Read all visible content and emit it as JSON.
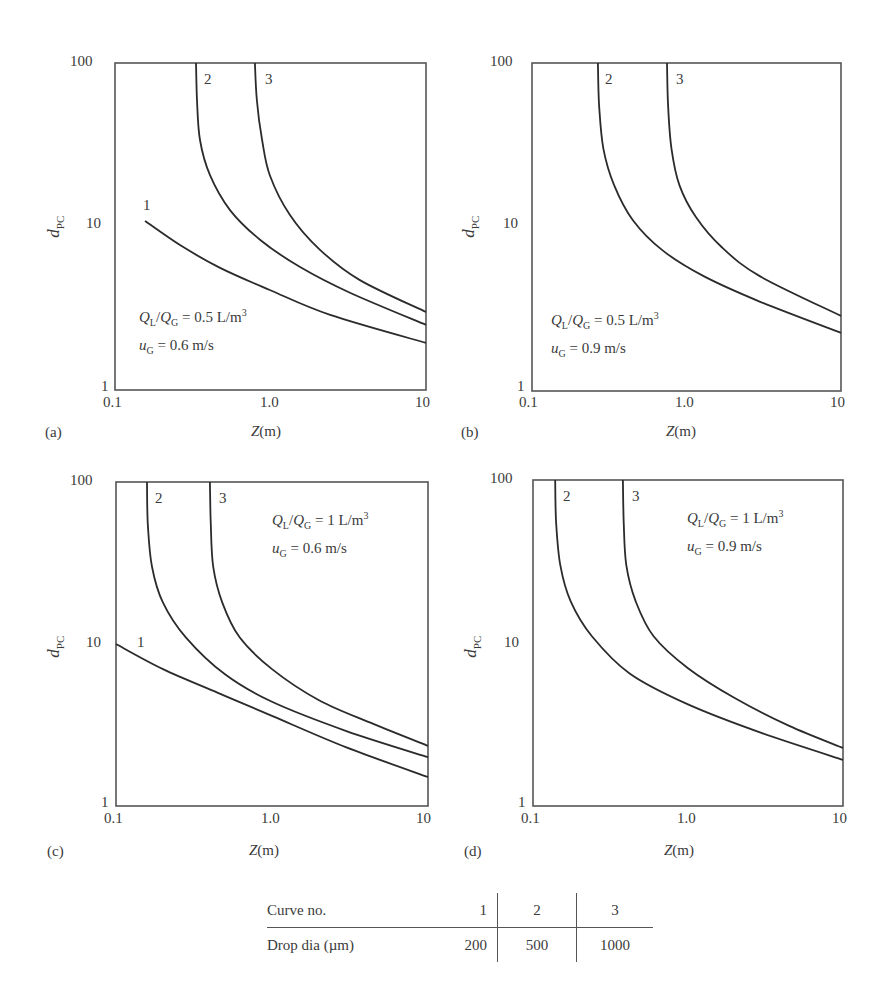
{
  "figure": {
    "legend_table": {
      "header": {
        "label": "Curve no.",
        "values": [
          "1",
          "2",
          "3"
        ]
      },
      "row": {
        "label": "Drop dia (µm)",
        "values": [
          "200",
          "500",
          "1000"
        ]
      }
    }
  },
  "chart_data": [
    {
      "type": "line",
      "panel": "(a)",
      "xlabel": "Z(m)",
      "ylabel": "dPC",
      "xscale": "log",
      "yscale": "log",
      "xlim": [
        0.1,
        10
      ],
      "ylim": [
        1,
        100
      ],
      "xticks": [
        "0.1",
        "1.0",
        "10"
      ],
      "yticks": [
        "1",
        "10",
        "100"
      ],
      "annotation": [
        "QL/QG = 0.5 L/m3",
        "uG = 0.6 m/s"
      ],
      "series": [
        {
          "name": "1",
          "drop_dia_um": 200,
          "points": [
            [
              0.156,
              10.8
            ],
            [
              0.262,
              7.7
            ],
            [
              0.474,
              5.58
            ],
            [
              0.99,
              4.09
            ],
            [
              2.42,
              2.88
            ],
            [
              10,
              1.94
            ]
          ]
        },
        {
          "name": "2",
          "drop_dia_um": 500,
          "points": [
            [
              0.332,
              100
            ],
            [
              0.337,
              59
            ],
            [
              0.352,
              33.8
            ],
            [
              0.408,
              20.6
            ],
            [
              0.549,
              12.6
            ],
            [
              0.856,
              8.3
            ],
            [
              1.55,
              5.65
            ],
            [
              3.27,
              3.92
            ],
            [
              10,
              2.5
            ]
          ]
        },
        {
          "name": "3",
          "drop_dia_um": 1000,
          "points": [
            [
              0.794,
              100
            ],
            [
              0.817,
              59
            ],
            [
              0.883,
              33.8
            ],
            [
              0.99,
              20.6
            ],
            [
              1.33,
              11.8
            ],
            [
              2.08,
              7.2
            ],
            [
              3.76,
              4.7
            ],
            [
              10,
              3.0
            ]
          ]
        }
      ]
    },
    {
      "type": "line",
      "panel": "(b)",
      "xlabel": "Z(m)",
      "ylabel": "dPC",
      "xscale": "log",
      "yscale": "log",
      "xlim": [
        0.1,
        10
      ],
      "ylim": [
        1,
        100
      ],
      "xticks": [
        "0.1",
        "1.0",
        "10"
      ],
      "yticks": [
        "1",
        "10",
        "100"
      ],
      "annotation": [
        "QL/QG = 0.5 L/m3",
        "uG = 0.9 m/s"
      ],
      "series": [
        {
          "name": "2",
          "drop_dia_um": 500,
          "points": [
            [
              0.267,
              100
            ],
            [
              0.272,
              55
            ],
            [
              0.29,
              30
            ],
            [
              0.34,
              18
            ],
            [
              0.45,
              11
            ],
            [
              0.7,
              7.2
            ],
            [
              1.3,
              5.0
            ],
            [
              3.0,
              3.5
            ],
            [
              10,
              2.26
            ]
          ]
        },
        {
          "name": "3",
          "drop_dia_um": 1000,
          "points": [
            [
              0.748,
              100
            ],
            [
              0.76,
              55
            ],
            [
              0.8,
              30
            ],
            [
              0.9,
              18
            ],
            [
              1.15,
              11.5
            ],
            [
              1.7,
              7.5
            ],
            [
              3.0,
              5.0
            ],
            [
              10,
              2.87
            ]
          ]
        }
      ]
    },
    {
      "type": "line",
      "panel": "(c)",
      "xlabel": "Z(m)",
      "ylabel": "dPC",
      "xscale": "log",
      "yscale": "log",
      "xlim": [
        0.1,
        10
      ],
      "ylim": [
        1,
        100
      ],
      "xticks": [
        "0.1",
        "1.0",
        "10"
      ],
      "yticks": [
        "1",
        "10",
        "100"
      ],
      "annotation": [
        "QL/QG = 1 L/m3",
        "uG = 0.6 m/s"
      ],
      "series": [
        {
          "name": "1",
          "drop_dia_um": 200,
          "points": [
            [
              0.1,
              10
            ],
            [
              0.2,
              7.0
            ],
            [
              0.45,
              5.0
            ],
            [
              1.0,
              3.6
            ],
            [
              3.0,
              2.3
            ],
            [
              10,
              1.51
            ]
          ]
        },
        {
          "name": "2",
          "drop_dia_um": 500,
          "points": [
            [
              0.158,
              100
            ],
            [
              0.16,
              55
            ],
            [
              0.17,
              30
            ],
            [
              0.2,
              18
            ],
            [
              0.28,
              11
            ],
            [
              0.5,
              6.5
            ],
            [
              1.0,
              4.4
            ],
            [
              3.0,
              2.9
            ],
            [
              10,
              2.0
            ]
          ]
        },
        {
          "name": "3",
          "drop_dia_um": 1000,
          "points": [
            [
              0.4,
              100
            ],
            [
              0.405,
              55
            ],
            [
              0.42,
              30
            ],
            [
              0.48,
              18
            ],
            [
              0.62,
              11
            ],
            [
              1.0,
              7.0
            ],
            [
              2.0,
              4.5
            ],
            [
              4.5,
              3.2
            ],
            [
              10,
              2.35
            ]
          ]
        }
      ]
    },
    {
      "type": "line",
      "panel": "(d)",
      "xlabel": "Z(m)",
      "ylabel": "dPC",
      "xscale": "log",
      "yscale": "log",
      "xlim": [
        0.1,
        10
      ],
      "ylim": [
        1,
        100
      ],
      "xticks": [
        "0.1",
        "1.0",
        "10"
      ],
      "yticks": [
        "1",
        "10",
        "100"
      ],
      "annotation": [
        "QL/QG = 1 L/m3",
        "uG = 0.9 m/s"
      ],
      "series": [
        {
          "name": "2",
          "drop_dia_um": 500,
          "points": [
            [
              0.139,
              100
            ],
            [
              0.141,
              55
            ],
            [
              0.15,
              30
            ],
            [
              0.175,
              18
            ],
            [
              0.24,
              11
            ],
            [
              0.42,
              6.5
            ],
            [
              1.0,
              4.2
            ],
            [
              3.0,
              2.8
            ],
            [
              10,
              1.92
            ]
          ]
        },
        {
          "name": "3",
          "drop_dia_um": 1000,
          "points": [
            [
              0.38,
              100
            ],
            [
              0.385,
              55
            ],
            [
              0.4,
              30
            ],
            [
              0.46,
              18
            ],
            [
              0.6,
              11
            ],
            [
              1.0,
              7.0
            ],
            [
              2.0,
              4.6
            ],
            [
              4.5,
              3.1
            ],
            [
              10,
              2.27
            ]
          ]
        }
      ]
    }
  ],
  "panels": [
    {
      "tag": "(a)",
      "xlabel": "Z",
      "xunit": "(m)",
      "ylabel": "d",
      "ysub": "PC",
      "annot1": {
        "q": "Q",
        "qs": "L",
        "q2": "Q",
        "q2s": "G",
        "val": " = 0.5 L/m",
        "sup": "3"
      },
      "annot2": {
        "u": "u",
        "us": "G",
        "val": " = 0.6 m/s"
      },
      "ticks": {
        "x0": "0.1",
        "x1": "1.0",
        "x2": "10",
        "y0": "1",
        "y1": "10",
        "y2": "100"
      }
    },
    {
      "tag": "(b)",
      "xlabel": "Z",
      "xunit": "(m)",
      "ylabel": "d",
      "ysub": "PC",
      "annot1": {
        "q": "Q",
        "qs": "L",
        "q2": "Q",
        "q2s": "G",
        "val": " = 0.5 L/m",
        "sup": "3"
      },
      "annot2": {
        "u": "u",
        "us": "G",
        "val": " = 0.9 m/s"
      },
      "ticks": {
        "x0": "0.1",
        "x1": "1.0",
        "x2": "10",
        "y0": "1",
        "y1": "10",
        "y2": "100"
      }
    },
    {
      "tag": "(c)",
      "xlabel": "Z",
      "xunit": "(m)",
      "ylabel": "d",
      "ysub": "PC",
      "annot1": {
        "q": "Q",
        "qs": "L",
        "q2": "Q",
        "q2s": "G",
        "val": " = 1 L/m",
        "sup": "3"
      },
      "annot2": {
        "u": "u",
        "us": "G",
        "val": " = 0.6 m/s"
      },
      "ticks": {
        "x0": "0.1",
        "x1": "1.0",
        "x2": "10",
        "y0": "1",
        "y1": "10",
        "y2": "100"
      }
    },
    {
      "tag": "(d)",
      "xlabel": "Z",
      "xunit": "(m)",
      "ylabel": "d",
      "ysub": "PC",
      "annot1": {
        "q": "Q",
        "qs": "L",
        "q2": "Q",
        "q2s": "G",
        "val": " = 1 L/m",
        "sup": "3"
      },
      "annot2": {
        "u": "u",
        "us": "G",
        "val": " = 0.9 m/s"
      },
      "ticks": {
        "x0": "0.1",
        "x1": "1.0",
        "x2": "10",
        "y0": "1",
        "y1": "10",
        "y2": "100"
      }
    }
  ],
  "curve_labels": {
    "a": [
      "1",
      "2",
      "3"
    ],
    "b": [
      "2",
      "3"
    ],
    "c": [
      "1",
      "2",
      "3"
    ],
    "d": [
      "2",
      "3"
    ]
  },
  "colors": {
    "line": "#2b2b2b",
    "frame": "#555555",
    "text": "#3a3a3a"
  }
}
